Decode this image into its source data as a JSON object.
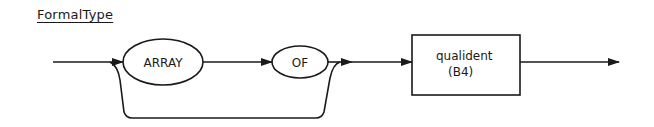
{
  "diagram": {
    "title": "FormalType",
    "type": "syntax-diagram",
    "nodes": [
      {
        "id": "array",
        "kind": "terminal",
        "label": "ARRAY"
      },
      {
        "id": "of",
        "kind": "terminal",
        "label": "OF"
      },
      {
        "id": "qualident",
        "kind": "nonterminal",
        "label": "qualident",
        "ref": "(B4)"
      }
    ],
    "edges": [
      {
        "from": "start",
        "to": "array"
      },
      {
        "from": "array",
        "to": "of"
      },
      {
        "from": "of",
        "to": "qualident"
      },
      {
        "from": "start",
        "to": "qualident",
        "note": "bypass (optional ARRAY OF)"
      },
      {
        "from": "qualident",
        "to": "end"
      }
    ],
    "colors": {
      "stroke": "#1a1a1a",
      "background": "#ffffff"
    }
  }
}
